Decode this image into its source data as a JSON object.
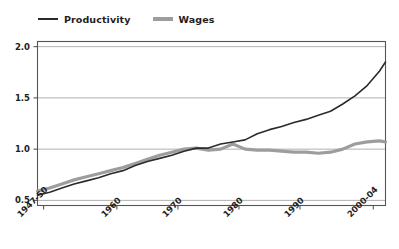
{
  "chart_data": {
    "type": "line",
    "title": "",
    "subtitle": "",
    "xlabel": "",
    "ylabel": "",
    "grid": true,
    "legend_position": "top-left",
    "xlim": [
      1947,
      2004
    ],
    "ylim": [
      0.45,
      2.05
    ],
    "yticks": [
      "2.0",
      "1.5",
      "1.0",
      "0.5"
    ],
    "ytick_values": [
      2.0,
      1.5,
      1.0,
      0.5
    ],
    "xticks": [
      "1947-50",
      "1960",
      "1970",
      "1980",
      "1990",
      "2000-04"
    ],
    "xtick_values": [
      1948,
      1960,
      1970,
      1980,
      1990,
      2002
    ],
    "colors": {
      "productivity": "#2b2b2b",
      "wages": "#9d9d9d",
      "grid": "#a8a8a8",
      "axis": "#555555",
      "text": "#1d1d1d",
      "background": "#ffffff"
    },
    "series": [
      {
        "name": "Productivity",
        "color": "#2b2b2b",
        "x": [
          1947,
          1949,
          1951,
          1953,
          1955,
          1957,
          1959,
          1961,
          1963,
          1965,
          1967,
          1969,
          1971,
          1973,
          1975,
          1977,
          1979,
          1981,
          1983,
          1985,
          1987,
          1989,
          1991,
          1993,
          1995,
          1997,
          1999,
          2001,
          2003,
          2004
        ],
        "values": [
          0.55,
          0.58,
          0.62,
          0.66,
          0.69,
          0.72,
          0.76,
          0.79,
          0.84,
          0.88,
          0.91,
          0.94,
          0.98,
          1.01,
          1.01,
          1.05,
          1.07,
          1.09,
          1.15,
          1.19,
          1.22,
          1.26,
          1.29,
          1.33,
          1.37,
          1.44,
          1.52,
          1.62,
          1.76,
          1.85
        ]
      },
      {
        "name": "Wages",
        "color": "#9d9d9d",
        "x": [
          1947,
          1949,
          1951,
          1953,
          1955,
          1957,
          1959,
          1961,
          1963,
          1965,
          1967,
          1969,
          1971,
          1973,
          1975,
          1977,
          1979,
          1981,
          1983,
          1985,
          1987,
          1989,
          1991,
          1993,
          1995,
          1997,
          1999,
          2001,
          2003,
          2004
        ],
        "values": [
          0.59,
          0.62,
          0.66,
          0.7,
          0.73,
          0.76,
          0.79,
          0.82,
          0.86,
          0.9,
          0.94,
          0.97,
          1.0,
          1.01,
          0.99,
          1.0,
          1.05,
          1.0,
          0.99,
          0.99,
          0.98,
          0.97,
          0.97,
          0.96,
          0.97,
          1.0,
          1.05,
          1.07,
          1.08,
          1.07
        ]
      }
    ]
  },
  "legend": {
    "entries": [
      {
        "label": "Productivity",
        "key": "productivity"
      },
      {
        "label": "Wages",
        "key": "wages"
      }
    ]
  }
}
